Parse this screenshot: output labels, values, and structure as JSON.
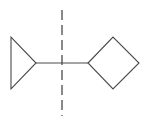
{
  "diagram": {
    "type": "chemical-structure",
    "colors": {
      "line": "#4a4a4a",
      "background": "#ffffff"
    },
    "fragments": [
      {
        "name": "cyclopropane-ring",
        "shape": "triangle",
        "points": "11,37 11,89 36,63"
      },
      {
        "name": "connecting-bond",
        "shape": "line",
        "x1": 36,
        "y1": 63,
        "x2": 88,
        "y2": 63
      },
      {
        "name": "cyclobutane-ring",
        "shape": "square-rotated-45",
        "points": "88,63 113,37 139,63 113,89"
      },
      {
        "name": "dashed-axis",
        "shape": "dashed-line",
        "x1": 62,
        "y1": 10,
        "x2": 62,
        "y2": 116
      }
    ]
  }
}
